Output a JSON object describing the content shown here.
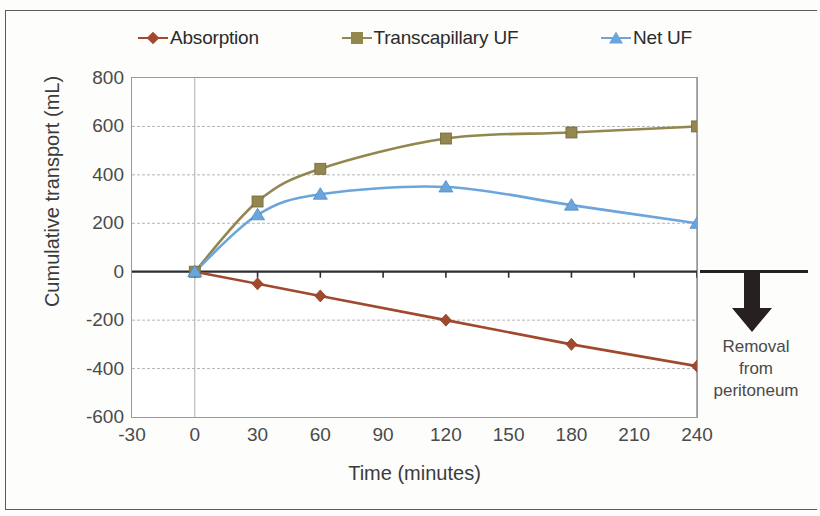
{
  "chart_data": {
    "type": "line",
    "title": "",
    "xlabel": "Time (minutes)",
    "ylabel": "Cumulative transport (mL)",
    "xlim": [
      -30,
      240
    ],
    "ylim": [
      -600,
      800
    ],
    "xticks": [
      "-30",
      "0",
      "30",
      "60",
      "90",
      "120",
      "150",
      "180",
      "210",
      "240"
    ],
    "yticks": [
      "800",
      "600",
      "400",
      "200",
      "0",
      "-200",
      "-400",
      "-600"
    ],
    "grid": true,
    "legend_position": "top",
    "x": [
      0,
      30,
      60,
      120,
      180,
      240
    ],
    "series": [
      {
        "name": "Absorption",
        "color": "#A0492E",
        "marker": "diamond",
        "x": [
          0,
          30,
          60,
          120,
          180,
          240
        ],
        "values": [
          0,
          -50,
          -100,
          -200,
          -300,
          -390
        ]
      },
      {
        "name": "Transcapillary UF",
        "color": "#93874F",
        "marker": "square",
        "x": [
          0,
          30,
          60,
          120,
          180,
          240
        ],
        "values": [
          0,
          290,
          425,
          550,
          575,
          600
        ]
      },
      {
        "name": "Net UF",
        "color": "#6BA5DB",
        "marker": "triangle",
        "x": [
          0,
          30,
          60,
          120,
          180,
          240
        ],
        "values": [
          0,
          235,
          320,
          350,
          275,
          200
        ]
      }
    ],
    "annotations": [
      {
        "name": "removal-from-peritoneum",
        "lines": [
          "Removal",
          "from",
          "peritoneum"
        ],
        "arrow": "down",
        "color": "#262020"
      }
    ]
  },
  "legend": {
    "items": [
      {
        "label": "Absorption",
        "color": "#A0492E",
        "marker": "diamond"
      },
      {
        "label": "Transcapillary UF",
        "color": "#93874F",
        "marker": "square"
      },
      {
        "label": "Net UF",
        "color": "#6BA5DB",
        "marker": "triangle"
      }
    ]
  },
  "axes": {
    "x_title": "Time (minutes)",
    "y_title": "Cumulative transport (mL)",
    "x_ticks": [
      "-30",
      "0",
      "30",
      "60",
      "90",
      "120",
      "150",
      "180",
      "210",
      "240"
    ],
    "y_ticks": [
      "800",
      "600",
      "400",
      "200",
      "0",
      "-200",
      "-400",
      "-600"
    ]
  },
  "annotation": {
    "line1": "Removal",
    "line2": "from",
    "line3": "peritoneum"
  }
}
